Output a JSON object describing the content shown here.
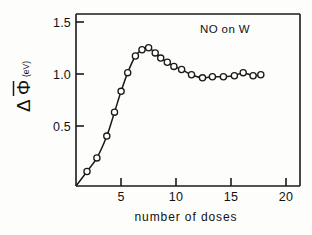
{
  "figure": {
    "title": "NO on W",
    "xlabel": "number of doses",
    "ylabel_symbol": "Δ Φ",
    "ylabel_unit": "(eV)"
  },
  "axes": {
    "x_ticks": [
      "5",
      "10",
      "15",
      "20"
    ],
    "y_ticks": [
      "1.5",
      "1.0",
      "0.5"
    ]
  },
  "chart_data": {
    "type": "line",
    "title": "NO on W",
    "xlabel": "number of doses",
    "ylabel": "Δ Φ̄ (eV)",
    "xlim": [
      0,
      20.4
    ],
    "ylim": [
      0,
      1.66
    ],
    "grid": false,
    "legend": null,
    "marker": "open-circle",
    "x_ticks": [
      5,
      10,
      15,
      20
    ],
    "y_ticks": [
      0.5,
      1.0,
      1.5
    ],
    "x": [
      0.0,
      1.0,
      1.9,
      2.8,
      3.5,
      4.1,
      4.7,
      5.4,
      6.0,
      6.6,
      7.2,
      7.7,
      8.3,
      8.9,
      9.6,
      10.5,
      11.5,
      12.4,
      13.4,
      14.4,
      15.2,
      16.1,
      16.8
    ],
    "y": [
      0.0,
      0.14,
      0.27,
      0.48,
      0.71,
      0.91,
      1.09,
      1.25,
      1.31,
      1.33,
      1.28,
      1.23,
      1.19,
      1.15,
      1.12,
      1.07,
      1.04,
      1.05,
      1.05,
      1.06,
      1.09,
      1.06,
      1.07
    ],
    "series": [
      {
        "name": "NO on W",
        "points": [
          {
            "x": 0.0,
            "y": 0.0
          },
          {
            "x": 1.0,
            "y": 0.14
          },
          {
            "x": 1.9,
            "y": 0.27
          },
          {
            "x": 2.8,
            "y": 0.48
          },
          {
            "x": 3.5,
            "y": 0.71
          },
          {
            "x": 4.1,
            "y": 0.91
          },
          {
            "x": 4.7,
            "y": 1.09
          },
          {
            "x": 5.4,
            "y": 1.25
          },
          {
            "x": 6.0,
            "y": 1.31
          },
          {
            "x": 6.6,
            "y": 1.33
          },
          {
            "x": 7.2,
            "y": 1.28
          },
          {
            "x": 7.7,
            "y": 1.23
          },
          {
            "x": 8.3,
            "y": 1.19
          },
          {
            "x": 8.9,
            "y": 1.15
          },
          {
            "x": 9.6,
            "y": 1.12
          },
          {
            "x": 10.5,
            "y": 1.07
          },
          {
            "x": 11.5,
            "y": 1.04
          },
          {
            "x": 12.4,
            "y": 1.05
          },
          {
            "x": 13.4,
            "y": 1.05
          },
          {
            "x": 14.4,
            "y": 1.06
          },
          {
            "x": 15.2,
            "y": 1.09
          },
          {
            "x": 16.1,
            "y": 1.06
          },
          {
            "x": 16.8,
            "y": 1.07
          }
        ]
      }
    ]
  }
}
